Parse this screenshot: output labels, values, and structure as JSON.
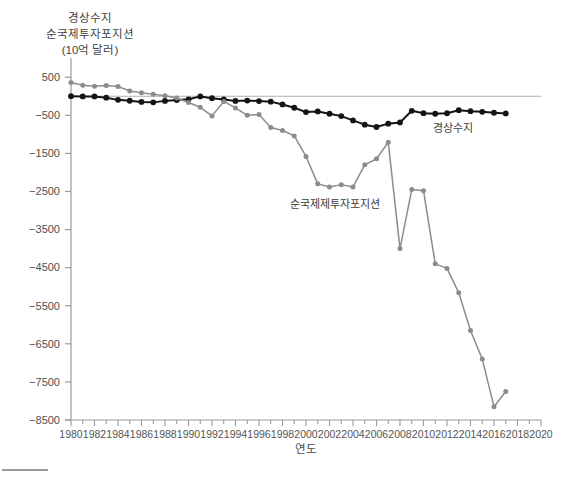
{
  "figure": {
    "title_lines": [
      "경상수지",
      "순국제투자포지션",
      "(10억 달러)"
    ],
    "xlabel": "연도",
    "series_labels": {
      "current_account": "경상수지",
      "niip": "순국제제투자포지션"
    }
  },
  "colors": {
    "current_account": "#141414",
    "niip": "#8c8c8c",
    "axis": "#9a9a9a",
    "zero_line": "#b0b0b0",
    "text": "#4a4a4a",
    "caption_rule": "#7a7a7a"
  },
  "chart_data": {
    "type": "line",
    "title": "경상수지 순국제투자포지션 (10억 달러)",
    "xlabel": "연도",
    "ylabel": "(10억 달러)",
    "grid": false,
    "legend": "inline-annotation",
    "xlim": [
      1980,
      2020
    ],
    "ylim": [
      -8500,
      900
    ],
    "xticks": [
      1980,
      1982,
      1984,
      1986,
      1988,
      1990,
      1992,
      1994,
      1996,
      1998,
      2000,
      2002,
      2004,
      2006,
      2008,
      2010,
      2012,
      2014,
      2016,
      2018,
      2020
    ],
    "xtick_minor_step": 1,
    "yticks": [
      500,
      -500,
      -1500,
      -2500,
      -3500,
      -4500,
      -5500,
      -6500,
      -7500,
      -8500
    ],
    "x": [
      1980,
      1981,
      1982,
      1983,
      1984,
      1985,
      1986,
      1987,
      1988,
      1989,
      1990,
      1991,
      1992,
      1993,
      1994,
      1995,
      1996,
      1997,
      1998,
      1999,
      2000,
      2001,
      2002,
      2003,
      2004,
      2005,
      2006,
      2007,
      2008,
      2009,
      2010,
      2011,
      2012,
      2013,
      2014,
      2015,
      2016,
      2017
    ],
    "series": [
      {
        "name": "경상수지",
        "color": "#141414",
        "marker": "circle",
        "values": [
          2,
          -5,
          -5,
          -38,
          -94,
          -118,
          -147,
          -160,
          -121,
          -99,
          -79,
          -3,
          -50,
          -85,
          -122,
          -114,
          -125,
          -141,
          -215,
          -301,
          -416,
          -397,
          -459,
          -521,
          -634,
          -745,
          -807,
          -719,
          -687,
          -381,
          -444,
          -459,
          -446,
          -366,
          -392,
          -408,
          -433,
          -449
        ]
      },
      {
        "name": "순국제투자포지션",
        "color": "#8c8c8c",
        "marker": "circle",
        "values": [
          360,
          290,
          265,
          285,
          255,
          140,
          90,
          55,
          15,
          -45,
          -165,
          -290,
          -515,
          -135,
          -305,
          -500,
          -480,
          -820,
          -900,
          -1040,
          -1580,
          -2300,
          -2380,
          -2320,
          -2380,
          -1800,
          -1640,
          -1210,
          -4000,
          -2450,
          -2480,
          -4400,
          -4520,
          -5160,
          -6150,
          -6900,
          -8150,
          -7750
        ]
      }
    ]
  }
}
